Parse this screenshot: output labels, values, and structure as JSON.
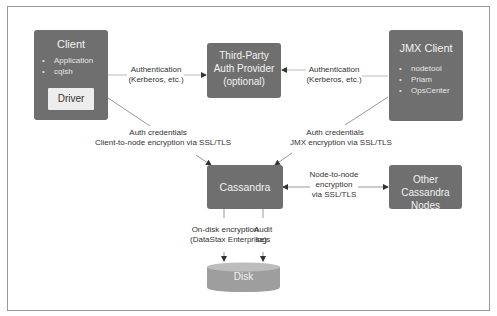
{
  "diagram": {
    "nodes": {
      "client": {
        "title": "Client",
        "items": [
          "Application",
          "cqlsh"
        ],
        "inner": "Driver"
      },
      "third_party": {
        "line1": "Third-Party",
        "line2": "Auth Provider",
        "line3": "(optional)"
      },
      "jmx_client": {
        "title": "JMX Client",
        "items": [
          "nodetool",
          "Priam",
          "OpsCenter"
        ]
      },
      "cassandra_node": {
        "title": "Cassandra Node"
      },
      "other_nodes": {
        "line1": "Other Cassandra",
        "line2": "Nodes"
      },
      "disk": {
        "title": "Disk"
      }
    },
    "edges": {
      "client_auth": {
        "line1": "Authentication",
        "line2": "(Kerberos, etc.)"
      },
      "jmx_auth": {
        "line1": "Authentication",
        "line2": "(Kerberos, etc.)"
      },
      "client_node": {
        "line1": "Auth credentials",
        "line2": "Client-to-node encryption via SSL/TLS"
      },
      "jmx_node": {
        "line1": "Auth credentials",
        "line2": "JMX encryption via SSL/TLS"
      },
      "node_node": {
        "line1": "Node-to-node",
        "line2": "encryption",
        "line3": "via SSL/TLS"
      },
      "on_disk": {
        "line1": "On-disk encryption",
        "line2": "(DataStax Enterprise)"
      },
      "audit": {
        "line1": "Audit",
        "line2": "logs"
      }
    },
    "colors": {
      "box": "#6f6f6f",
      "box_text": "#f2f2f2",
      "driver_bg": "#ededed",
      "line": "#9a9a9a",
      "arrow": "#333333",
      "disk": "#a8a8a8"
    }
  }
}
